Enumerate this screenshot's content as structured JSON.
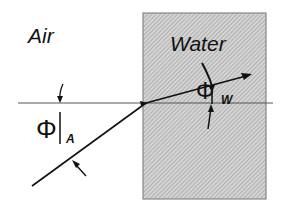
{
  "diagram": {
    "regions": [
      {
        "name": "air",
        "label": "Air"
      },
      {
        "name": "water",
        "label": "Water",
        "fill": "#c8c8c8",
        "pattern": "diagonal-hatch"
      }
    ],
    "angles": [
      {
        "symbol": "Φ",
        "subscript": "A",
        "meaning": "angle of incidence in air"
      },
      {
        "symbol": "Φ",
        "subscript": "W",
        "meaning": "angle of refraction in water"
      }
    ],
    "elements": [
      "horizontal normal line",
      "incident ray",
      "refracted ray with arrowhead",
      "angle arrows"
    ],
    "colors": {
      "line": "#111111",
      "water": "#c8c8c8",
      "background": "#ffffff"
    }
  }
}
